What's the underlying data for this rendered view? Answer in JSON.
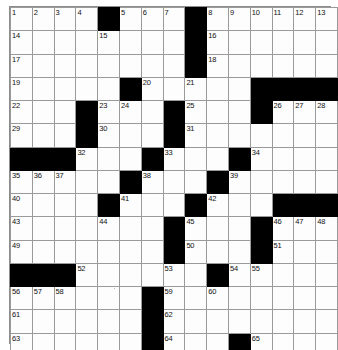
{
  "puzzle": {
    "title": "Crossword Puzzle Grid",
    "type": "crossword",
    "rows": 15,
    "columns": 15,
    "cell_size_px": 21.2,
    "colors": {
      "block": "#000000",
      "cell": "#fdfdfd",
      "grid_line": "#9a9a9a",
      "number_text": "#111111",
      "page_background": "#ffffff"
    },
    "highest_clue_number": 65,
    "grid": [
      [
        {
          "type": "open",
          "number": "1"
        },
        {
          "type": "open",
          "number": "2"
        },
        {
          "type": "open",
          "number": "3"
        },
        {
          "type": "open",
          "number": "4"
        },
        {
          "type": "block",
          "number": ""
        },
        {
          "type": "open",
          "number": "5"
        },
        {
          "type": "open",
          "number": "6"
        },
        {
          "type": "open",
          "number": "7"
        },
        {
          "type": "block",
          "number": ""
        },
        {
          "type": "open",
          "number": "8"
        },
        {
          "type": "open",
          "number": "9"
        },
        {
          "type": "open",
          "number": "10"
        },
        {
          "type": "open",
          "number": "11"
        },
        {
          "type": "open",
          "number": "12"
        },
        {
          "type": "open",
          "number": "13"
        }
      ],
      [
        {
          "type": "open",
          "number": "14"
        },
        {
          "type": "open",
          "number": ""
        },
        {
          "type": "open",
          "number": ""
        },
        {
          "type": "open",
          "number": ""
        },
        {
          "type": "open",
          "number": "15"
        },
        {
          "type": "open",
          "number": ""
        },
        {
          "type": "open",
          "number": ""
        },
        {
          "type": "open",
          "number": ""
        },
        {
          "type": "block",
          "number": ""
        },
        {
          "type": "open",
          "number": "16"
        },
        {
          "type": "open",
          "number": ""
        },
        {
          "type": "open",
          "number": ""
        },
        {
          "type": "open",
          "number": ""
        },
        {
          "type": "open",
          "number": ""
        },
        {
          "type": "open",
          "number": ""
        }
      ],
      [
        {
          "type": "open",
          "number": "17"
        },
        {
          "type": "open",
          "number": ""
        },
        {
          "type": "open",
          "number": ""
        },
        {
          "type": "open",
          "number": ""
        },
        {
          "type": "open",
          "number": ""
        },
        {
          "type": "open",
          "number": ""
        },
        {
          "type": "open",
          "number": ""
        },
        {
          "type": "open",
          "number": ""
        },
        {
          "type": "block",
          "number": ""
        },
        {
          "type": "open",
          "number": "18"
        },
        {
          "type": "open",
          "number": ""
        },
        {
          "type": "open",
          "number": ""
        },
        {
          "type": "open",
          "number": ""
        },
        {
          "type": "open",
          "number": ""
        },
        {
          "type": "open",
          "number": ""
        }
      ],
      [
        {
          "type": "open",
          "number": "19"
        },
        {
          "type": "open",
          "number": ""
        },
        {
          "type": "open",
          "number": ""
        },
        {
          "type": "open",
          "number": ""
        },
        {
          "type": "open",
          "number": ""
        },
        {
          "type": "block",
          "number": ""
        },
        {
          "type": "open",
          "number": "20"
        },
        {
          "type": "open",
          "number": ""
        },
        {
          "type": "open",
          "number": "21"
        },
        {
          "type": "open",
          "number": ""
        },
        {
          "type": "open",
          "number": ""
        },
        {
          "type": "block",
          "number": ""
        },
        {
          "type": "block",
          "number": ""
        },
        {
          "type": "block",
          "number": ""
        },
        {
          "type": "block",
          "number": ""
        }
      ],
      [
        {
          "type": "open",
          "number": "22"
        },
        {
          "type": "open",
          "number": ""
        },
        {
          "type": "open",
          "number": ""
        },
        {
          "type": "block",
          "number": ""
        },
        {
          "type": "open",
          "number": "23"
        },
        {
          "type": "open",
          "number": "24"
        },
        {
          "type": "open",
          "number": ""
        },
        {
          "type": "block",
          "number": ""
        },
        {
          "type": "open",
          "number": "25"
        },
        {
          "type": "open",
          "number": ""
        },
        {
          "type": "open",
          "number": ""
        },
        {
          "type": "block",
          "number": ""
        },
        {
          "type": "open",
          "number": "26"
        },
        {
          "type": "open",
          "number": "27"
        },
        {
          "type": "open",
          "number": "28"
        }
      ],
      [
        {
          "type": "open",
          "number": "29"
        },
        {
          "type": "open",
          "number": ""
        },
        {
          "type": "open",
          "number": ""
        },
        {
          "type": "block",
          "number": ""
        },
        {
          "type": "open",
          "number": "30"
        },
        {
          "type": "open",
          "number": ""
        },
        {
          "type": "open",
          "number": ""
        },
        {
          "type": "block",
          "number": ""
        },
        {
          "type": "open",
          "number": "31"
        },
        {
          "type": "open",
          "number": ""
        },
        {
          "type": "open",
          "number": ""
        },
        {
          "type": "open",
          "number": ""
        },
        {
          "type": "open",
          "number": ""
        },
        {
          "type": "open",
          "number": ""
        },
        {
          "type": "open",
          "number": ""
        }
      ],
      [
        {
          "type": "block",
          "number": ""
        },
        {
          "type": "block",
          "number": ""
        },
        {
          "type": "block",
          "number": ""
        },
        {
          "type": "open",
          "number": "32"
        },
        {
          "type": "open",
          "number": ""
        },
        {
          "type": "open",
          "number": ""
        },
        {
          "type": "block",
          "number": ""
        },
        {
          "type": "open",
          "number": "33"
        },
        {
          "type": "open",
          "number": ""
        },
        {
          "type": "open",
          "number": ""
        },
        {
          "type": "block",
          "number": ""
        },
        {
          "type": "open",
          "number": "34"
        },
        {
          "type": "open",
          "number": ""
        },
        {
          "type": "open",
          "number": ""
        },
        {
          "type": "open",
          "number": ""
        }
      ],
      [
        {
          "type": "open",
          "number": "35"
        },
        {
          "type": "open",
          "number": "36"
        },
        {
          "type": "open",
          "number": "37"
        },
        {
          "type": "open",
          "number": ""
        },
        {
          "type": "open",
          "number": ""
        },
        {
          "type": "block",
          "number": ""
        },
        {
          "type": "open",
          "number": "38"
        },
        {
          "type": "open",
          "number": ""
        },
        {
          "type": "open",
          "number": ""
        },
        {
          "type": "block",
          "number": ""
        },
        {
          "type": "open",
          "number": "39"
        },
        {
          "type": "open",
          "number": ""
        },
        {
          "type": "open",
          "number": ""
        },
        {
          "type": "open",
          "number": ""
        },
        {
          "type": "open",
          "number": ""
        }
      ],
      [
        {
          "type": "open",
          "number": "40"
        },
        {
          "type": "open",
          "number": ""
        },
        {
          "type": "open",
          "number": ""
        },
        {
          "type": "open",
          "number": ""
        },
        {
          "type": "block",
          "number": ""
        },
        {
          "type": "open",
          "number": "41"
        },
        {
          "type": "open",
          "number": ""
        },
        {
          "type": "open",
          "number": ""
        },
        {
          "type": "block",
          "number": ""
        },
        {
          "type": "open",
          "number": "42"
        },
        {
          "type": "open",
          "number": ""
        },
        {
          "type": "open",
          "number": ""
        },
        {
          "type": "block",
          "number": ""
        },
        {
          "type": "block",
          "number": ""
        },
        {
          "type": "block",
          "number": ""
        }
      ],
      [
        {
          "type": "open",
          "number": "43"
        },
        {
          "type": "open",
          "number": ""
        },
        {
          "type": "open",
          "number": ""
        },
        {
          "type": "open",
          "number": ""
        },
        {
          "type": "open",
          "number": "44"
        },
        {
          "type": "open",
          "number": ""
        },
        {
          "type": "open",
          "number": ""
        },
        {
          "type": "block",
          "number": ""
        },
        {
          "type": "open",
          "number": "45"
        },
        {
          "type": "open",
          "number": ""
        },
        {
          "type": "open",
          "number": ""
        },
        {
          "type": "block",
          "number": ""
        },
        {
          "type": "open",
          "number": "46"
        },
        {
          "type": "open",
          "number": "47"
        },
        {
          "type": "open",
          "number": "48"
        }
      ],
      [
        {
          "type": "open",
          "number": "49"
        },
        {
          "type": "open",
          "number": ""
        },
        {
          "type": "open",
          "number": ""
        },
        {
          "type": "open",
          "number": ""
        },
        {
          "type": "open",
          "number": ""
        },
        {
          "type": "open",
          "number": ""
        },
        {
          "type": "open",
          "number": ""
        },
        {
          "type": "block",
          "number": ""
        },
        {
          "type": "open",
          "number": "50"
        },
        {
          "type": "open",
          "number": ""
        },
        {
          "type": "open",
          "number": ""
        },
        {
          "type": "block",
          "number": ""
        },
        {
          "type": "open",
          "number": "51"
        },
        {
          "type": "open",
          "number": ""
        },
        {
          "type": "open",
          "number": ""
        }
      ],
      [
        {
          "type": "block",
          "number": ""
        },
        {
          "type": "block",
          "number": ""
        },
        {
          "type": "block",
          "number": ""
        },
        {
          "type": "open",
          "number": "52"
        },
        {
          "type": "open",
          "number": ""
        },
        {
          "type": "open",
          "number": ""
        },
        {
          "type": "open",
          "number": ""
        },
        {
          "type": "open",
          "number": "53"
        },
        {
          "type": "open",
          "number": ""
        },
        {
          "type": "block",
          "number": ""
        },
        {
          "type": "open",
          "number": "54"
        },
        {
          "type": "open",
          "number": "55"
        },
        {
          "type": "open",
          "number": ""
        },
        {
          "type": "open",
          "number": ""
        },
        {
          "type": "open",
          "number": ""
        }
      ],
      [
        {
          "type": "open",
          "number": "56"
        },
        {
          "type": "open",
          "number": "57"
        },
        {
          "type": "open",
          "number": "58"
        },
        {
          "type": "open",
          "number": ""
        },
        {
          "type": "open",
          "number": ""
        },
        {
          "type": "open",
          "number": ""
        },
        {
          "type": "block",
          "number": ""
        },
        {
          "type": "open",
          "number": "59"
        },
        {
          "type": "open",
          "number": ""
        },
        {
          "type": "open",
          "number": "60"
        },
        {
          "type": "open",
          "number": ""
        },
        {
          "type": "open",
          "number": ""
        },
        {
          "type": "open",
          "number": ""
        },
        {
          "type": "open",
          "number": ""
        },
        {
          "type": "open",
          "number": ""
        }
      ],
      [
        {
          "type": "open",
          "number": "61"
        },
        {
          "type": "open",
          "number": ""
        },
        {
          "type": "open",
          "number": ""
        },
        {
          "type": "open",
          "number": ""
        },
        {
          "type": "open",
          "number": ""
        },
        {
          "type": "open",
          "number": ""
        },
        {
          "type": "block",
          "number": ""
        },
        {
          "type": "open",
          "number": "62"
        },
        {
          "type": "open",
          "number": ""
        },
        {
          "type": "open",
          "number": ""
        },
        {
          "type": "open",
          "number": ""
        },
        {
          "type": "open",
          "number": ""
        },
        {
          "type": "open",
          "number": ""
        },
        {
          "type": "open",
          "number": ""
        },
        {
          "type": "open",
          "number": ""
        }
      ],
      [
        {
          "type": "open",
          "number": "63"
        },
        {
          "type": "open",
          "number": ""
        },
        {
          "type": "open",
          "number": ""
        },
        {
          "type": "open",
          "number": ""
        },
        {
          "type": "open",
          "number": ""
        },
        {
          "type": "open",
          "number": ""
        },
        {
          "type": "block",
          "number": ""
        },
        {
          "type": "open",
          "number": "64"
        },
        {
          "type": "open",
          "number": ""
        },
        {
          "type": "open",
          "number": ""
        },
        {
          "type": "block",
          "number": ""
        },
        {
          "type": "open",
          "number": "65"
        },
        {
          "type": "open",
          "number": ""
        },
        {
          "type": "open",
          "number": ""
        },
        {
          "type": "open",
          "number": ""
        }
      ]
    ]
  }
}
